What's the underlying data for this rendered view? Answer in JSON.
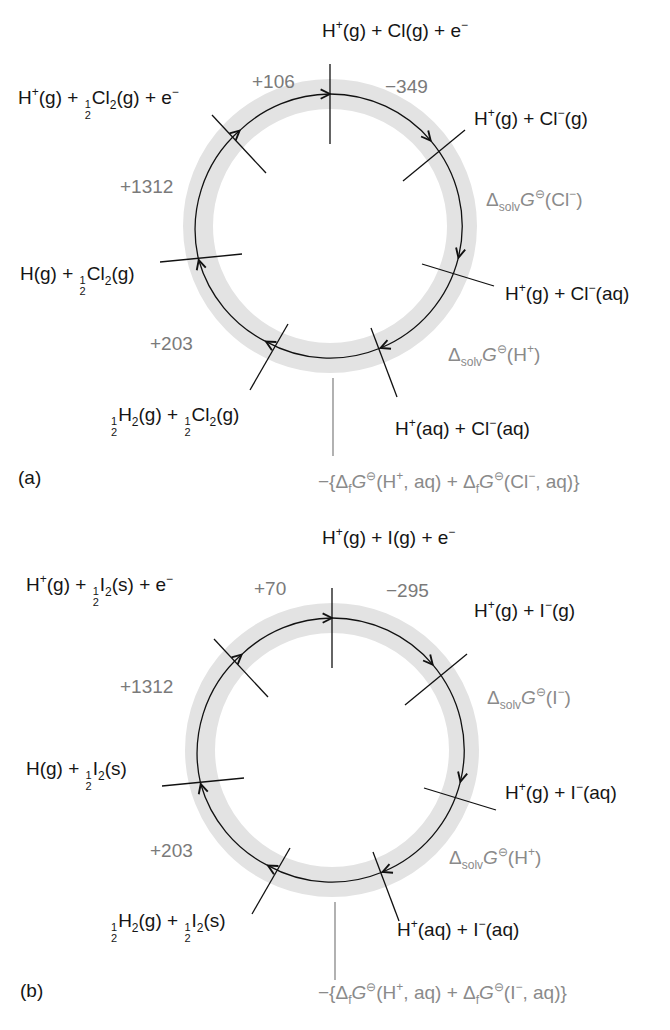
{
  "figure": {
    "panels": [
      {
        "tag": "(a)",
        "halogen": "Cl",
        "species": {
          "top": {
            "pre": "H",
            "sup1": "+",
            "mid": "(g) + Cl(g) + e",
            "sup2": "−"
          },
          "top_left": {
            "pre": "H",
            "sup1": "+",
            "mid1": "(g) + ",
            "frac_num": "1",
            "frac_den": "2",
            "mid2": "Cl",
            "sub": "2",
            "post": "(g) + e",
            "sup2": "−"
          },
          "left": {
            "pre": "H(g) + ",
            "frac_num": "1",
            "frac_den": "2",
            "mid": "Cl",
            "sub": "2",
            "post": "(g)"
          },
          "bottom_left": {
            "frac1_num": "1",
            "frac1_den": "2",
            "a": "H",
            "sub1": "2",
            "b": "(g) + ",
            "frac2_num": "1",
            "frac2_den": "2",
            "c": "Cl",
            "sub2": "2",
            "d": "(g)"
          },
          "top_right": {
            "pre": "H",
            "sup1": "+",
            "mid": "(g) + Cl",
            "sup2": "−",
            "post": "(g)"
          },
          "right": {
            "pre": "H",
            "sup1": "+",
            "mid": "(g) + Cl",
            "sup2": "−",
            "post": "(aq)"
          },
          "bottom_right": {
            "pre": "H",
            "sup1": "+",
            "mid": "(aq) + Cl",
            "sup2": "−",
            "post": "(aq)"
          }
        },
        "values": {
          "atomization": "+106",
          "electron_gain": "−349",
          "ionization": "+1312",
          "dissociation": "+203"
        },
        "gray_labels": {
          "solv_anion": {
            "delta": "Δ",
            "sub": "solv",
            "G": "G",
            "std": "⊖",
            "post": "(Cl",
            "sup": "−",
            "close": ")"
          },
          "solv_cation": {
            "delta": "Δ",
            "sub": "solv",
            "G": "G",
            "std": "⊖",
            "post": "(H",
            "sup": "+",
            "close": ")"
          },
          "formation": {
            "a": "−{Δ",
            "s1": "f",
            "G1": "G",
            "std1": "⊖",
            "b": "(H",
            "sup1": "+",
            "c": ", aq) + Δ",
            "s2": "f",
            "G2": "G",
            "std2": "⊖",
            "d": "(Cl",
            "sup2": "−",
            "e": ", aq)}"
          }
        }
      },
      {
        "tag": "(b)",
        "halogen": "I",
        "species": {
          "top": {
            "pre": "H",
            "sup1": "+",
            "mid": "(g) + I(g) + e",
            "sup2": "−"
          },
          "top_left": {
            "pre": "H",
            "sup1": "+",
            "mid1": "(g) + ",
            "frac_num": "1",
            "frac_den": "2",
            "mid2": "I",
            "sub": "2",
            "post": "(s) + e",
            "sup2": "−"
          },
          "left": {
            "pre": "H(g) + ",
            "frac_num": "1",
            "frac_den": "2",
            "mid": "I",
            "sub": "2",
            "post": "(s)"
          },
          "bottom_left": {
            "frac1_num": "1",
            "frac1_den": "2",
            "a": "H",
            "sub1": "2",
            "b": "(g) + ",
            "frac2_num": "1",
            "frac2_den": "2",
            "c": "I",
            "sub2": "2",
            "d": "(s)"
          },
          "top_right": {
            "pre": "H",
            "sup1": "+",
            "mid": "(g) + I",
            "sup2": "−",
            "post": "(g)"
          },
          "right": {
            "pre": "H",
            "sup1": "+",
            "mid": "(g) + I",
            "sup2": "−",
            "post": "(aq)"
          },
          "bottom_right": {
            "pre": "H",
            "sup1": "+",
            "mid": "(aq) + I",
            "sup2": "−",
            "post": "(aq)"
          }
        },
        "values": {
          "atomization": "+70",
          "electron_gain": "−295",
          "ionization": "+1312",
          "dissociation": "+203"
        },
        "gray_labels": {
          "solv_anion": {
            "delta": "Δ",
            "sub": "solv",
            "G": "G",
            "std": "⊖",
            "post": "(I",
            "sup": "−",
            "close": ")"
          },
          "solv_cation": {
            "delta": "Δ",
            "sub": "solv",
            "G": "G",
            "std": "⊖",
            "post": "(H",
            "sup": "+",
            "close": ")"
          },
          "formation": {
            "a": "−{Δ",
            "s1": "f",
            "G1": "G",
            "std1": "⊖",
            "b": "(H",
            "sup1": "+",
            "c": ", aq) + Δ",
            "s2": "f",
            "G2": "G",
            "std2": "⊖",
            "d": "(I",
            "sup2": "−",
            "e": ", aq)}"
          }
        }
      }
    ],
    "colors": {
      "ring": "#e3e3e3",
      "line": "#111111",
      "value_text": "#7a7a7a",
      "label_text": "#151515"
    }
  }
}
